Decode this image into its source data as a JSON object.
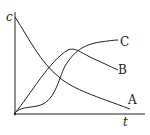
{
  "diagram": {
    "axes": {
      "y_label": "c",
      "x_label": "t"
    },
    "curves": [
      {
        "name": "A",
        "label": "A",
        "shape": "decreasing"
      },
      {
        "name": "B",
        "label": "B",
        "shape": "rise-then-fall"
      },
      {
        "name": "C",
        "label": "C",
        "shape": "sigmoid-rise"
      }
    ],
    "colors": {
      "line": "#222222",
      "background": "#ffffff"
    }
  }
}
